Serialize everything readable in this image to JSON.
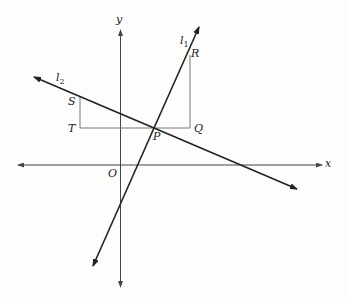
{
  "diagram": {
    "type": "coordinate-geometry",
    "axes": {
      "x_label": "x",
      "y_label": "y",
      "origin_label": "O"
    },
    "lines": [
      {
        "name": "l1",
        "label_base": "l",
        "label_sub": "1",
        "description": "steep positive slope line through P and R"
      },
      {
        "name": "l2",
        "label_base": "l",
        "label_sub": "2",
        "description": "shallow negative slope line through S and P"
      }
    ],
    "points": {
      "P": "P",
      "Q": "Q",
      "R": "R",
      "S": "S",
      "T": "T"
    },
    "segments": [
      "TQ",
      "QR",
      "TS"
    ],
    "colors": {
      "line": "#222222",
      "helper": "#777777",
      "background": "#fdfdfb"
    }
  }
}
